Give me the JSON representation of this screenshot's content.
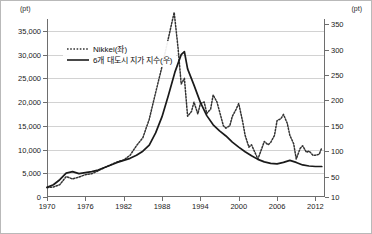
{
  "chart_data": {
    "type": "line",
    "title": "",
    "xlabel": "",
    "left_axis": {
      "unit_label": "(pt)",
      "ticks": [
        0,
        5000,
        10000,
        15000,
        20000,
        25000,
        30000,
        35000
      ],
      "tick_labels": [
        "0",
        "5,000",
        "10,000",
        "15,000",
        "20,000",
        "25,000",
        "30,000",
        "35,000"
      ],
      "min": 0,
      "max": 37500
    },
    "right_axis": {
      "unit_label": "(pt)",
      "ticks": [
        10,
        50,
        100,
        150,
        200,
        250,
        300,
        350
      ],
      "tick_labels": [
        "10",
        "50",
        "100",
        "150",
        "200",
        "250",
        "300",
        "350"
      ],
      "min": 10,
      "max": 360
    },
    "x_ticks": [
      1970,
      1976,
      1982,
      1988,
      1994,
      2000,
      2006,
      2012
    ],
    "x_tick_labels": [
      "1970",
      "1976",
      "1982",
      "1988",
      "1994",
      "2000",
      "2006",
      "2012"
    ],
    "xlim": [
      1970,
      2013.5
    ],
    "grid": true,
    "legend_position": "upper-left",
    "series": [
      {
        "name": "Nikkei(좌)",
        "axis": "left",
        "style": "dotted",
        "color": "#333333",
        "x": [
          1970,
          1971,
          1972,
          1973,
          1974,
          1975,
          1976,
          1977,
          1978,
          1979,
          1980,
          1981,
          1982,
          1983,
          1984,
          1985,
          1986,
          1987,
          1988,
          1989,
          1989.9,
          1990.5,
          1991,
          1991.5,
          1992,
          1992.6,
          1993,
          1993.6,
          1994,
          1994.6,
          1995,
          1995.6,
          1996,
          1996.6,
          1997,
          1997.6,
          1998,
          1998.6,
          1999,
          1999.6,
          2000,
          2000.6,
          2001,
          2001.6,
          2002,
          2002.6,
          2003,
          2003.6,
          2004,
          2004.6,
          2005,
          2005.6,
          2006,
          2006.6,
          2007,
          2007.6,
          2008,
          2008.6,
          2009,
          2009.6,
          2010,
          2010.6,
          2011,
          2011.6,
          2012,
          2012.6,
          2013
        ],
        "y": [
          1990,
          2100,
          2600,
          4300,
          3800,
          4200,
          4700,
          4900,
          5500,
          6200,
          6800,
          7400,
          7800,
          8800,
          10800,
          12500,
          16400,
          22000,
          27500,
          33500,
          38900,
          31500,
          23800,
          25000,
          17000,
          18000,
          20000,
          17500,
          19700,
          20000,
          17600,
          18500,
          21500,
          20000,
          18000,
          15000,
          14500,
          15000,
          17000,
          18500,
          19700,
          16000,
          13000,
          10500,
          11000,
          9200,
          8000,
          10200,
          11700,
          11000,
          11500,
          13000,
          16100,
          16500,
          17400,
          15500,
          13000,
          11200,
          8000,
          10200,
          10800,
          9400,
          9700,
          8800,
          8800,
          9000,
          10400
        ]
      },
      {
        "name": "6개 대도시 지가 지수(우)",
        "axis": "right",
        "style": "solid",
        "color": "#1a1a1a",
        "x": [
          1970,
          1971,
          1972,
          1973,
          1974,
          1975,
          1976,
          1977,
          1978,
          1979,
          1980,
          1981,
          1982,
          1983,
          1984,
          1985,
          1986,
          1987,
          1988,
          1989,
          1990,
          1991,
          1991.5,
          1992,
          1993,
          1994,
          1995,
          1996,
          1997,
          1998,
          1999,
          2000,
          2001,
          2002,
          2003,
          2004,
          2005,
          2006,
          2007,
          2008,
          2009,
          2010,
          2011,
          2012,
          2013
        ],
        "y": [
          29,
          34,
          44,
          57,
          60,
          56,
          58,
          60,
          63,
          68,
          73,
          78,
          82,
          86,
          92,
          100,
          112,
          136,
          168,
          210,
          255,
          290,
          296,
          262,
          230,
          196,
          170,
          152,
          140,
          130,
          118,
          108,
          99,
          91,
          84,
          79,
          76,
          75,
          78,
          82,
          78,
          73,
          71,
          70,
          70
        ]
      }
    ],
    "annotations": []
  }
}
